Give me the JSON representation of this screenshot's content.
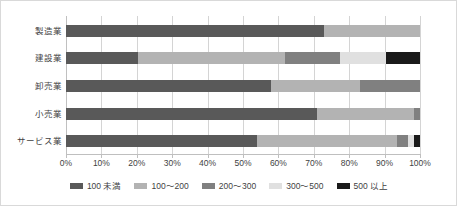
{
  "chart_data": {
    "type": "bar",
    "orientation": "horizontal",
    "stacked": true,
    "normalized_percent": true,
    "title": "",
    "subtitle": "",
    "xlabel": "",
    "ylabel": "",
    "xlim": [
      0,
      100
    ],
    "grid": true,
    "legend_position": "bottom",
    "categories": [
      "製造業",
      "建設業",
      "卸売業",
      "小売業",
      "サービス業"
    ],
    "xticks": [
      "0%",
      "10%",
      "20%",
      "30%",
      "40%",
      "50%",
      "60%",
      "70%",
      "80%",
      "90%",
      "100%"
    ],
    "xtick_values": [
      0,
      10,
      20,
      30,
      40,
      50,
      60,
      70,
      80,
      90,
      100
    ],
    "series": [
      {
        "name": "100 未満",
        "color": "#595959",
        "values": [
          73.0,
          20.3,
          57.9,
          71.0,
          54.0
        ]
      },
      {
        "name": "100〜200",
        "color": "#b3b3b3",
        "values": [
          27.0,
          41.6,
          25.2,
          27.3,
          39.5
        ]
      },
      {
        "name": "200〜300",
        "color": "#808080",
        "values": [
          0.0,
          15.5,
          16.9,
          1.7,
          3.1
        ]
      },
      {
        "name": "300〜500",
        "color": "#e0e0e0",
        "values": [
          0.0,
          13.0,
          0.0,
          0.0,
          1.7
        ]
      },
      {
        "name": "500 以上",
        "color": "#1a1a1a",
        "values": [
          0.0,
          9.6,
          0.0,
          0.0,
          1.7
        ]
      }
    ]
  },
  "legend": {
    "items": [
      {
        "label": "100 未満",
        "color": "#595959"
      },
      {
        "label": "100〜200",
        "color": "#b3b3b3"
      },
      {
        "label": "200〜300",
        "color": "#808080"
      },
      {
        "label": "300〜500",
        "color": "#e0e0e0"
      },
      {
        "label": "500 以上",
        "color": "#1a1a1a"
      }
    ]
  },
  "colors": {
    "grid": "#d4d4d4",
    "axis": "#bfbfbf",
    "text": "#3f3f3f",
    "background": "#ffffff",
    "border": "#d9d9d9"
  }
}
